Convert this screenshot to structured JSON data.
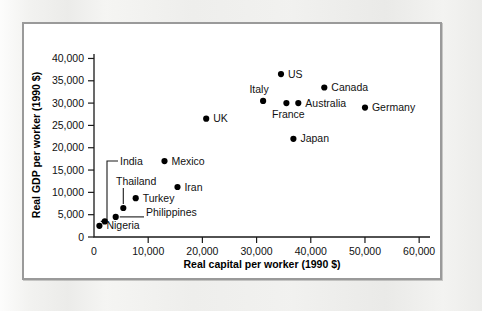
{
  "figure": {
    "background_color": "#ffffff",
    "page_color": "#eeeeec",
    "frame_color": "#9a9a9a"
  },
  "chart_data": {
    "type": "scatter",
    "title": "",
    "xlabel": "Real capital per worker (1990 $)",
    "ylabel": "Real GDP per worker (1990 $)",
    "xlim": [
      0,
      62000
    ],
    "ylim": [
      0,
      41000
    ],
    "xticks": [
      0,
      10000,
      20000,
      30000,
      40000,
      50000,
      60000
    ],
    "xticklabels": [
      "0",
      "10,000",
      "20,000",
      "30,000",
      "40,000",
      "50,000",
      "60,000"
    ],
    "yticks": [
      0,
      5000,
      10000,
      15000,
      20000,
      25000,
      30000,
      35000,
      40000
    ],
    "yticklabels": [
      "0",
      "5,000",
      "10,000",
      "15,000",
      "20,000",
      "25,000",
      "30,000",
      "35,000",
      "40,000"
    ],
    "grid": false,
    "legend": "none",
    "marker": "filled-circle",
    "marker_color": "#000000",
    "points": [
      {
        "name": "Nigeria",
        "x": 1000,
        "y": 2500,
        "label": "Nigeria",
        "label_pos": "right",
        "leader": "none"
      },
      {
        "name": "India",
        "x": 2000,
        "y": 3500,
        "label": "India",
        "label_pos": "callout",
        "leader": "elbow-up-left"
      },
      {
        "name": "Philippines",
        "x": 4000,
        "y": 4500,
        "label": "Philippines",
        "label_pos": "callout",
        "leader": "horizontal-right"
      },
      {
        "name": "Thailand",
        "x": 5400,
        "y": 6500,
        "label": "Thailand",
        "label_pos": "callout",
        "leader": "vertical-up"
      },
      {
        "name": "Turkey",
        "x": 7700,
        "y": 8700,
        "label": "Turkey",
        "label_pos": "right",
        "leader": "none"
      },
      {
        "name": "Mexico",
        "x": 13000,
        "y": 17000,
        "label": "Mexico",
        "label_pos": "right",
        "leader": "none"
      },
      {
        "name": "Iran",
        "x": 15400,
        "y": 11200,
        "label": "Iran",
        "label_pos": "right",
        "leader": "none"
      },
      {
        "name": "UK",
        "x": 20700,
        "y": 26500,
        "label": "UK",
        "label_pos": "right",
        "leader": "none"
      },
      {
        "name": "Italy",
        "x": 31200,
        "y": 30500,
        "label": "Italy",
        "label_pos": "above-left",
        "leader": "none"
      },
      {
        "name": "US",
        "x": 34500,
        "y": 36500,
        "label": "US",
        "label_pos": "right",
        "leader": "none"
      },
      {
        "name": "France",
        "x": 35500,
        "y": 30000,
        "label": "France",
        "label_pos": "below",
        "leader": "none"
      },
      {
        "name": "Japan",
        "x": 36800,
        "y": 22000,
        "label": "Japan",
        "label_pos": "right",
        "leader": "none"
      },
      {
        "name": "Australia",
        "x": 37700,
        "y": 30000,
        "label": "Australia",
        "label_pos": "right",
        "leader": "none"
      },
      {
        "name": "Canada",
        "x": 42500,
        "y": 33500,
        "label": "Canada",
        "label_pos": "right",
        "leader": "none"
      },
      {
        "name": "Germany",
        "x": 50000,
        "y": 29000,
        "label": "Germany",
        "label_pos": "right",
        "leader": "none"
      }
    ]
  }
}
